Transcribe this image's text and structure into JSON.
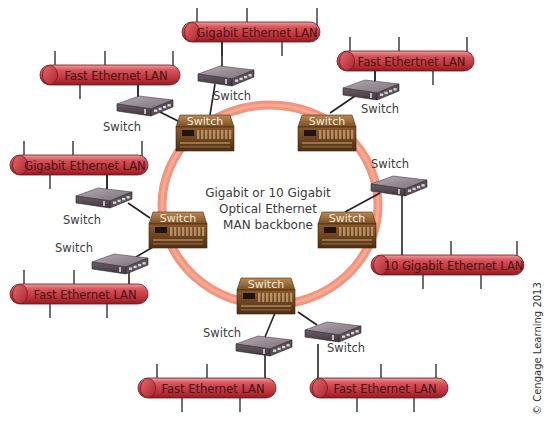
{
  "diagram": {
    "center_label_lines": [
      "Gigabit or 10 Gigabit",
      "Optical Ethernet",
      "MAN backbone"
    ],
    "copyright": "© Cengage Learning 2013",
    "ring": {
      "cx": 270,
      "cy": 205,
      "rx": 108,
      "ry": 100,
      "color": "#f2957c"
    },
    "colors": {
      "lan_tube": "#c9363f",
      "lan_tube_light": "#e88a8e",
      "core_switch": "#8a5a2a",
      "edge_switch": "#8a7f8a"
    },
    "core_switches": [
      {
        "id": "core-top-left",
        "label": "Switch",
        "x": 176,
        "y": 115
      },
      {
        "id": "core-top-right",
        "label": "Switch",
        "x": 298,
        "y": 115
      },
      {
        "id": "core-left",
        "label": "Switch",
        "x": 149,
        "y": 212
      },
      {
        "id": "core-right",
        "label": "Switch",
        "x": 318,
        "y": 212
      },
      {
        "id": "core-bottom",
        "label": "Switch",
        "x": 237,
        "y": 278
      }
    ],
    "edge_switches": [
      {
        "id": "sw-top",
        "label": "Switch",
        "x": 198,
        "y": 66,
        "lx": 232,
        "ly": 100
      },
      {
        "id": "sw-top-left",
        "label": "Switch",
        "x": 117,
        "y": 96,
        "lx": 122,
        "ly": 131
      },
      {
        "id": "sw-top-right",
        "label": "Switch",
        "x": 343,
        "y": 80,
        "lx": 380,
        "ly": 113
      },
      {
        "id": "sw-left-upper",
        "label": "Switch",
        "x": 76,
        "y": 188,
        "lx": 82,
        "ly": 224
      },
      {
        "id": "sw-left-lower",
        "label": "Switch",
        "x": 92,
        "y": 254,
        "lx": 74,
        "ly": 252
      },
      {
        "id": "sw-right",
        "label": "Switch",
        "x": 371,
        "y": 176,
        "lx": 390,
        "ly": 168
      },
      {
        "id": "sw-bottom-left",
        "label": "Switch",
        "x": 236,
        "y": 336,
        "lx": 222,
        "ly": 337
      },
      {
        "id": "sw-bottom-right",
        "label": "Switch",
        "x": 305,
        "y": 322,
        "lx": 346,
        "ly": 352
      }
    ],
    "lans": [
      {
        "id": "lan-top",
        "label": "Gigabit Ethernet LAN",
        "x": 182,
        "y": 22,
        "w": 138,
        "h": 20,
        "taps_up": [
          197,
          247,
          317
        ],
        "taps_down": [
          222,
          282
        ]
      },
      {
        "id": "lan-top-left",
        "label": "Fast Ethernet LAN",
        "x": 40,
        "y": 65,
        "w": 140,
        "h": 20,
        "taps_up": [
          55,
          105,
          173
        ],
        "taps_down": [
          80,
          138
        ]
      },
      {
        "id": "lan-top-right",
        "label": "Fast Ethertnet LAN",
        "x": 337,
        "y": 51,
        "w": 137,
        "h": 20,
        "taps_up": [
          350,
          399,
          467
        ],
        "taps_down": [
          375,
          433
        ]
      },
      {
        "id": "lan-left",
        "label": "Gigabit Ethernet LAN",
        "x": 10,
        "y": 155,
        "w": 138,
        "h": 20,
        "taps_up": [
          24,
          73,
          142
        ],
        "taps_down": [
          50,
          107
        ]
      },
      {
        "id": "lan-left-bottom",
        "label": "Fast Ethernet LAN",
        "x": 10,
        "y": 284,
        "w": 138,
        "h": 20,
        "taps_up": [
          24,
          74
        ],
        "taps_down": [
          50,
          107
        ]
      },
      {
        "id": "lan-right",
        "label": "10 Gigabit Ethernet LAN",
        "x": 371,
        "y": 255,
        "w": 153,
        "h": 20,
        "taps_up": [
          451,
          517
        ],
        "taps_down": [
          423,
          481
        ]
      },
      {
        "id": "lan-bottom-left",
        "label": "Fast Ethernet LAN",
        "x": 138,
        "y": 378,
        "w": 138,
        "h": 20,
        "taps_up": [
          157,
          207
        ],
        "taps_down": [
          182,
          240
        ]
      },
      {
        "id": "lan-bottom-right",
        "label": "Fast Ethernet LAN",
        "x": 310,
        "y": 378,
        "w": 138,
        "h": 20,
        "taps_up": [
          381,
          436
        ],
        "taps_down": [
          357,
          414
        ]
      }
    ]
  }
}
